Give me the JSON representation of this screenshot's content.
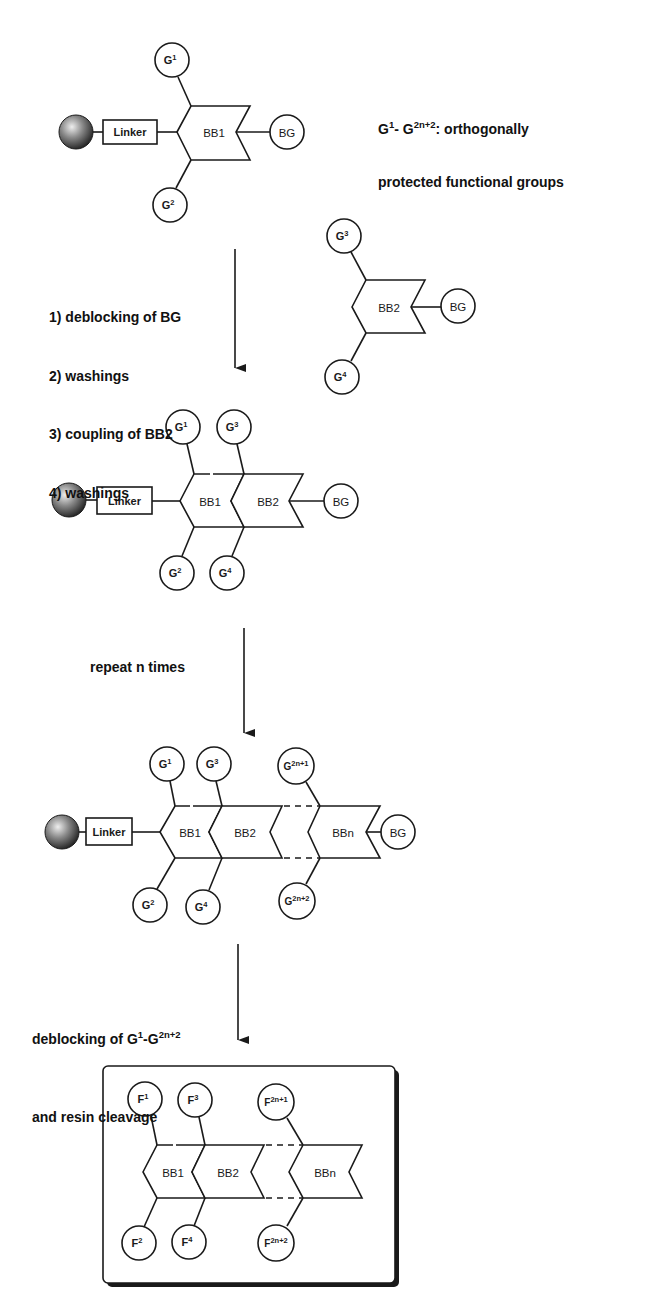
{
  "legend": {
    "line1_prefix": "G",
    "line1_sup1": "1",
    "line1_mid": "- G",
    "line1_sup2": "2n+2",
    "line1_suffix": ": orthogonally",
    "line2": "protected functional groups"
  },
  "labels": {
    "linker": "Linker",
    "bb1": "BB1",
    "bb2": "BB2",
    "bbn": "BBn",
    "bg": "BG",
    "g": "G",
    "f": "F"
  },
  "superscripts": {
    "s1": "1",
    "s2": "2",
    "s3": "3",
    "s4": "4",
    "s2n1": "2n+1",
    "s2n2": "2n+2"
  },
  "steps": {
    "step1": {
      "lines": [
        "1) deblocking of BG",
        "2) washings",
        "3) coupling of BB2",
        "4) washings"
      ]
    },
    "step2": {
      "text": "repeat n times"
    },
    "step3": {
      "line1_prefix": "deblocking of G",
      "line1_sup1": "1",
      "line1_mid": "-G",
      "line1_sup2": "2n+2",
      "line2": "and resin cleavage"
    }
  },
  "colors": {
    "ink": "#1a1a1a",
    "background": "#ffffff",
    "resin_bead_light": "#e8e8e8",
    "resin_bead_dark": "#1e1e1e"
  }
}
